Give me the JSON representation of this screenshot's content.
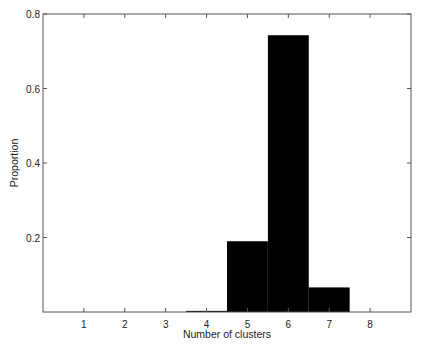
{
  "chart_data": {
    "type": "bar",
    "title": "",
    "xlabel": "Number of clusters",
    "ylabel": "Proportion",
    "categories": [
      "1",
      "2",
      "3",
      "4",
      "5",
      "6",
      "7",
      "8"
    ],
    "x": [
      1,
      2,
      3,
      4,
      5,
      6,
      7,
      8
    ],
    "values": [
      0,
      0,
      0,
      0.003,
      0.19,
      0.743,
      0.066,
      0
    ],
    "xlim": [
      0,
      9
    ],
    "ylim": [
      0,
      0.8
    ],
    "xticks": [
      "1",
      "2",
      "3",
      "4",
      "5",
      "6",
      "7",
      "8"
    ],
    "yticks": [
      "0.2",
      "0.4",
      "0.6",
      "0.8"
    ],
    "bar_color": "#000000",
    "grid": false,
    "legend": null
  },
  "axes": {
    "xlabel": "Number of clusters",
    "ylabel": "Proportion"
  }
}
